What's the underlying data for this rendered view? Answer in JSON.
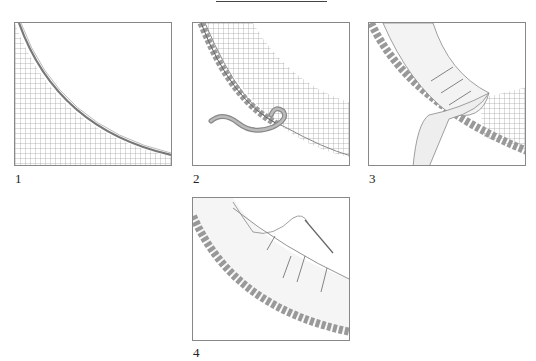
{
  "figure": {
    "panels": [
      {
        "id": 1,
        "label": "1",
        "description": "Quarter-circle mesh area with thin curved edge"
      },
      {
        "id": 2,
        "label": "2",
        "description": "Braided cord edging along mesh curve with loose cord end"
      },
      {
        "id": 3,
        "label": "3",
        "description": "Fabric band pinned over braided edge, folded around curve"
      },
      {
        "id": 4,
        "label": "4",
        "description": "Fabric band stitched along curve with needle and thread"
      }
    ]
  }
}
